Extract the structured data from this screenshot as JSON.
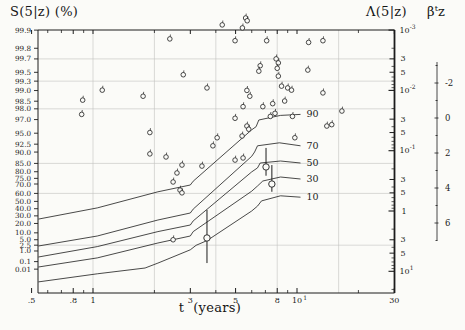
{
  "figure": {
    "y_left_title": "S(5|z) (%)",
    "y_right_title": "Λ(5|z)",
    "beta_title": {
      "base": "β",
      "sup": "t",
      "tail": "z"
    },
    "x_title": "t  (years)"
  },
  "colors": {
    "ink": "#1c1c1c",
    "grid": "#c3c3c0",
    "background": "#fbfbf8"
  },
  "chart_data": {
    "type": "scatter",
    "xlabel": "t (years)",
    "x_axis": {
      "scale": "log",
      "range": [
        0.5,
        30
      ],
      "major_ticks": [
        {
          "t": 0.5,
          "label": ".5"
        },
        {
          "t": 0.8,
          "label": ".8"
        },
        {
          "t": 1,
          "label": "1"
        },
        {
          "t": 3,
          "label": "3"
        },
        {
          "t": 5,
          "label": "5"
        },
        {
          "t": 8,
          "label": "8"
        },
        {
          "t": 10,
          "label": "10",
          "sup": "1"
        },
        {
          "t": 30,
          "label": "30"
        }
      ],
      "minor_ticks": [
        0.6,
        0.7,
        0.9,
        2,
        4,
        6,
        7,
        9,
        20
      ],
      "gridline_ts": [
        1,
        2,
        4,
        8,
        16
      ]
    },
    "y_left_axis": {
      "label": "S(5|z) (%)",
      "scale": "log of cumulative hazard -ln(S)",
      "tick_labels": [
        "99.9",
        "99.8",
        "99.7",
        "99.5",
        "99.3",
        "99.0",
        "98.5",
        "98.0",
        "97.0",
        "95.0",
        "92.5",
        "90.0",
        "85.0",
        "80.0",
        "75.0",
        "70.0",
        "60.0",
        "50.0",
        "40.0",
        "30.0",
        "20.0",
        "10.0",
        "5.0",
        "2.5",
        "1.0",
        "0.1",
        "0.01"
      ],
      "tick_values": [
        99.9,
        99.8,
        99.7,
        99.5,
        99.3,
        99.0,
        98.5,
        98.0,
        97.0,
        95.0,
        92.5,
        90.0,
        85.0,
        80.0,
        75.0,
        70.0,
        60.0,
        50.0,
        40.0,
        30.0,
        20.0,
        10.0,
        5.0,
        2.5,
        1.0,
        0.1,
        0.01
      ],
      "gridline_values": [
        99.7,
        99.3,
        98.0,
        85.0,
        60.0,
        2.5
      ]
    },
    "y_right_axis": {
      "label": "Λ(5|z)",
      "scale": "log",
      "range": [
        0.001,
        20
      ],
      "decades": [
        -3,
        -2,
        -1,
        0,
        1
      ],
      "labeled_minor_mantissas": [
        3,
        5
      ]
    },
    "beta_axis": {
      "label": "βᵗz",
      "labeled_ticks": [
        -2,
        0,
        2,
        4,
        6
      ],
      "minor_tick_step": 1,
      "minor_range": [
        -3,
        7
      ]
    },
    "percentile_curves": [
      {
        "label": "90",
        "points_t_lambda": [
          [
            0.54,
            1.36
          ],
          [
            1.05,
            0.89
          ],
          [
            2.08,
            0.48
          ],
          [
            3.0,
            0.37
          ],
          [
            3.1,
            0.32
          ],
          [
            6.0,
            0.045
          ],
          [
            6.3,
            0.04
          ],
          [
            6.5,
            0.031
          ],
          [
            8.3,
            0.026
          ],
          [
            10.4,
            0.025
          ]
        ]
      },
      {
        "label": "70",
        "points_t_lambda": [
          [
            0.54,
            3.8
          ],
          [
            1.05,
            2.6
          ],
          [
            2.08,
            1.41
          ],
          [
            3.0,
            1.08
          ],
          [
            3.1,
            0.93
          ],
          [
            6.0,
            0.124
          ],
          [
            6.2,
            0.105
          ],
          [
            6.4,
            0.083
          ],
          [
            8.2,
            0.074
          ],
          [
            10.4,
            0.083
          ]
        ]
      },
      {
        "label": "50",
        "points_t_lambda": [
          [
            0.54,
            5.8
          ],
          [
            1.05,
            3.9
          ],
          [
            2.08,
            2.2
          ],
          [
            3.0,
            1.71
          ],
          [
            3.1,
            1.46
          ],
          [
            6.0,
            0.225
          ],
          [
            6.4,
            0.193
          ],
          [
            6.6,
            0.16
          ],
          [
            8.3,
            0.148
          ],
          [
            10.4,
            0.16
          ]
        ]
      },
      {
        "label": "30",
        "points_t_lambda": [
          [
            0.54,
            8.5
          ],
          [
            1.05,
            6.0
          ],
          [
            2.08,
            3.4
          ],
          [
            3.0,
            2.6
          ],
          [
            3.1,
            2.2
          ],
          [
            6.0,
            0.47
          ],
          [
            6.4,
            0.385
          ],
          [
            6.8,
            0.318
          ],
          [
            8.3,
            0.273
          ],
          [
            10.4,
            0.295
          ]
        ]
      },
      {
        "label": "10",
        "points_t_lambda": [
          [
            0.54,
            15
          ],
          [
            1.05,
            11
          ],
          [
            1.8,
            8.8
          ],
          [
            2.08,
            7.3
          ],
          [
            3.0,
            4.4
          ],
          [
            3.2,
            3.7
          ],
          [
            3.62,
            3.1
          ],
          [
            6.0,
            1.0
          ],
          [
            6.4,
            0.83
          ],
          [
            6.7,
            0.68
          ],
          [
            8.3,
            0.56
          ],
          [
            10.4,
            0.59
          ]
        ]
      }
    ],
    "points_t_lambda": [
      [
        4.3,
        0.00082
      ],
      [
        5.6,
        0.00063
      ],
      [
        5.7,
        0.0007
      ],
      [
        5.4,
        0.00092
      ],
      [
        2.38,
        0.0014
      ],
      [
        4.97,
        0.0015
      ],
      [
        7.1,
        0.0015
      ],
      [
        11.4,
        0.0016
      ],
      [
        13.4,
        0.0015
      ],
      [
        7.9,
        0.003
      ],
      [
        8.1,
        0.0035
      ],
      [
        6.6,
        0.0039
      ],
      [
        6.5,
        0.0048
      ],
      [
        8.0,
        0.0043
      ],
      [
        8.1,
        0.0058
      ],
      [
        11.3,
        0.0046
      ],
      [
        2.77,
        0.0055
      ],
      [
        1.11,
        0.0099
      ],
      [
        3.62,
        0.0091
      ],
      [
        8.4,
        0.0085
      ],
      [
        9.0,
        0.0091
      ],
      [
        9.4,
        0.0099
      ],
      [
        13.4,
        0.011
      ],
      [
        1.76,
        0.0125
      ],
      [
        5.68,
        0.01
      ],
      [
        5.87,
        0.0125
      ],
      [
        0.89,
        0.0145
      ],
      [
        8.7,
        0.015
      ],
      [
        5.44,
        0.0186
      ],
      [
        6.8,
        0.0186
      ],
      [
        7.6,
        0.0166
      ],
      [
        0.88,
        0.025
      ],
      [
        4.97,
        0.029
      ],
      [
        7.4,
        0.027
      ],
      [
        7.8,
        0.024
      ],
      [
        9.5,
        0.027
      ],
      [
        16.6,
        0.022
      ],
      [
        14.0,
        0.039
      ],
      [
        14.8,
        0.037
      ],
      [
        5.68,
        0.039
      ],
      [
        5.8,
        0.044
      ],
      [
        5.38,
        0.057
      ],
      [
        1.9,
        0.05
      ],
      [
        4.06,
        0.061
      ],
      [
        3.87,
        0.083
      ],
      [
        9.76,
        0.061
      ],
      [
        4.97,
        0.143
      ],
      [
        1.9,
        0.113
      ],
      [
        2.28,
        0.127
      ],
      [
        5.44,
        0.132
      ],
      [
        2.73,
        0.173
      ],
      [
        3.42,
        0.18
      ],
      [
        2.58,
        0.234
      ],
      [
        2.47,
        0.33
      ],
      [
        2.67,
        0.45
      ],
      [
        2.73,
        0.5
      ],
      [
        2.47,
        3.0
      ]
    ],
    "error_bar_points": [
      {
        "t": 3.62,
        "lambda": 2.8,
        "lambda_lo": 0.96,
        "lambda_hi": 7.3
      },
      {
        "t": 7.05,
        "lambda": 0.186,
        "lambda_lo": 0.09,
        "lambda_hi": 0.26
      },
      {
        "t": 7.53,
        "lambda": 0.357,
        "lambda_lo": 0.173,
        "lambda_hi": 0.48
      }
    ]
  }
}
